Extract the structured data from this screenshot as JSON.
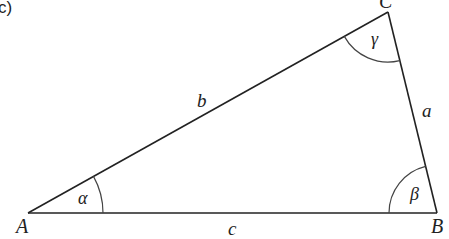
{
  "panel_label": "c)",
  "triangle": {
    "vertices": {
      "A": {
        "label": "A",
        "x": 28,
        "y": 213
      },
      "B": {
        "label": "B",
        "x": 437,
        "y": 213
      },
      "C": {
        "label": "C",
        "x": 388,
        "y": 12
      }
    },
    "sides": {
      "a": {
        "label": "a",
        "between": [
          "B",
          "C"
        ]
      },
      "b": {
        "label": "b",
        "between": [
          "A",
          "C"
        ]
      },
      "c": {
        "label": "c",
        "between": [
          "A",
          "B"
        ]
      }
    },
    "angles": {
      "alpha": {
        "label": "α",
        "at": "A"
      },
      "beta": {
        "label": "β",
        "at": "B"
      },
      "gamma": {
        "label": "γ",
        "at": "C"
      }
    }
  },
  "colors": {
    "stroke": "#222222",
    "arc": "#444444",
    "background": "#ffffff"
  }
}
